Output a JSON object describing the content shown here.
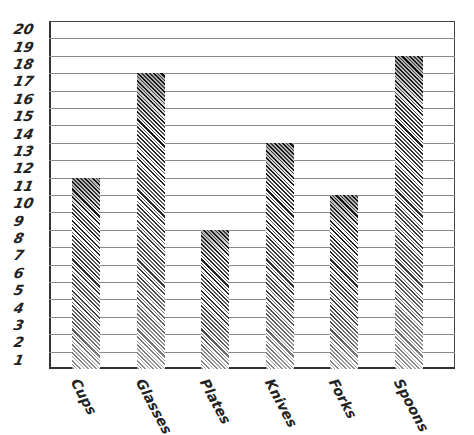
{
  "chart_data": {
    "type": "bar",
    "title": "",
    "xlabel": "",
    "ylabel": "",
    "categories": [
      "Cups",
      "Glasses",
      "Plates",
      "Knives",
      "Forks",
      "Spoons"
    ],
    "values": [
      11,
      17,
      8,
      13,
      10,
      18
    ],
    "ylim": [
      0,
      20
    ],
    "yticks": [
      "1",
      "2",
      "3",
      "4",
      "5",
      "6",
      "7",
      "8",
      "9",
      "10",
      "11",
      "12",
      "13",
      "14",
      "15",
      "16",
      "17",
      "18",
      "19",
      "20"
    ],
    "ytick_placement": "centered-in-band",
    "grid": true,
    "legend": null,
    "bar_fill": "diagonal-hatch",
    "colors": {
      "hatch_dark": "#1a1a1a",
      "gridline": "#8a8a8a",
      "axis": "#333333"
    }
  }
}
